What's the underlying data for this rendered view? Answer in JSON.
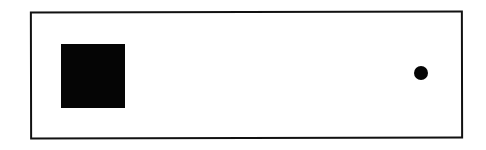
{
  "diagram": {
    "frame": {
      "shape": "rectangle",
      "fill": "#ffffff",
      "stroke": "#111111"
    },
    "elements": [
      {
        "shape": "square",
        "fill": "#050505",
        "position": "left"
      },
      {
        "shape": "circle",
        "fill": "#050505",
        "position": "right"
      }
    ]
  }
}
